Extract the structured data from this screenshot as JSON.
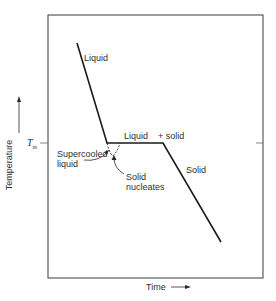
{
  "diagram": {
    "type": "cooling-curve",
    "axes": {
      "x_label": "Time",
      "y_label": "Temperature",
      "y_marker": {
        "symbol": "T",
        "subscript": "m"
      }
    },
    "annotations": {
      "liquid": "Liquid",
      "liquid_plus_solid_a": "Liquid",
      "liquid_plus_solid_b": "+ solid",
      "supercooled_line1": "Supercooled",
      "supercooled_line2": "liquid",
      "nucleates_line1": "Solid",
      "nucleates_line2": "nucleates",
      "solid": "Solid"
    },
    "colors": {
      "line": "#1a1a1a",
      "frame": "#3a3a3a",
      "text": "#2f2f2f"
    }
  }
}
